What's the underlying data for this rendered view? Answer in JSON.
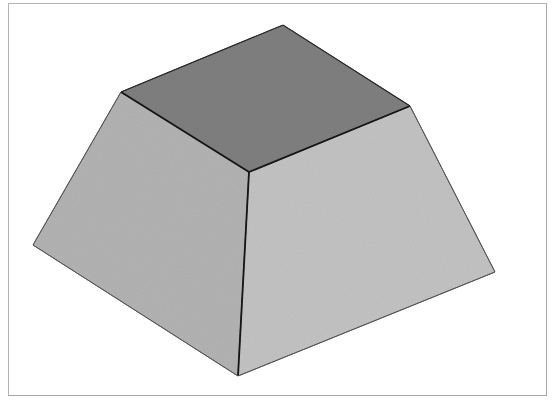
{
  "figure": {
    "type": "frustum",
    "colors": {
      "top_face": "#7e7e7e",
      "left_face": "#b4b4b4",
      "right_face": "#c2c2c2",
      "edge_dark": "#1a1a1a",
      "edge_light": "#555555",
      "frame_border": "#b0b0b0",
      "background": "#ffffff"
    },
    "vertices": {
      "top_back": [
        283,
        25
      ],
      "top_left": [
        121,
        92
      ],
      "top_front": [
        249,
        172
      ],
      "top_right": [
        410,
        106
      ],
      "base_left": [
        33,
        245
      ],
      "base_front": [
        238,
        376
      ],
      "base_right": [
        495,
        272
      ]
    }
  }
}
